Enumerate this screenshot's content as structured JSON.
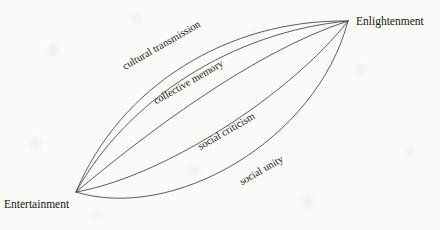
{
  "diagram": {
    "type": "lens-arc-diagram",
    "background_color": "#fafaf8",
    "stroke_color": "#4c4a47",
    "text_color": "#17150f",
    "nodes": [
      {
        "id": "entertainment",
        "label": "Entertainment",
        "position": "bottom-left",
        "x": 76,
        "y": 192
      },
      {
        "id": "enlightenment",
        "label": "Enlightenment",
        "position": "top-right",
        "x": 348,
        "y": 21
      }
    ],
    "arcs": [
      {
        "id": "arc-outer-top",
        "label": "",
        "labeled": false
      },
      {
        "id": "arc-cultural-transmission",
        "label": "cultural transmission",
        "labeled": true,
        "label_x": 163,
        "label_y": 48,
        "label_rotation": -30
      },
      {
        "id": "arc-collective-memory",
        "label": "collective memory",
        "labeled": true,
        "label_x": 190,
        "label_y": 85,
        "label_rotation": -30
      },
      {
        "id": "arc-social-criticism",
        "label": "social criticism",
        "labeled": true,
        "label_x": 228,
        "label_y": 134,
        "label_rotation": -30
      },
      {
        "id": "arc-social-unity",
        "label": "social unity",
        "labeled": true,
        "label_x": 263,
        "label_y": 173,
        "label_rotation": -30
      }
    ]
  }
}
